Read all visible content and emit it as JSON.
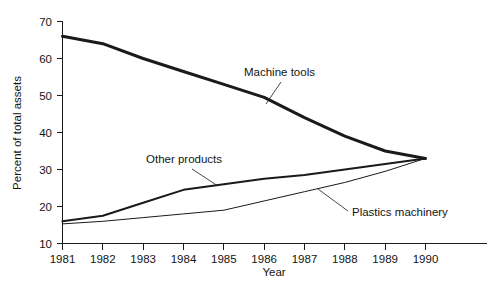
{
  "chart_data": {
    "type": "line",
    "title": "",
    "xlabel": "Year",
    "ylabel": "Percent of total assets",
    "grid": false,
    "legend_position": "inline-annotations",
    "x": [
      1981,
      1982,
      1983,
      1984,
      1985,
      1986,
      1987,
      1988,
      1989,
      1990
    ],
    "categories": [
      "1981",
      "1982",
      "1983",
      "1984",
      "1985",
      "1986",
      "1987",
      "1988",
      "1989",
      "1990"
    ],
    "xlim": [
      1981,
      1990
    ],
    "ylim": [
      10,
      70
    ],
    "ytick_values": [
      10,
      20,
      30,
      40,
      50,
      60,
      70
    ],
    "ytick_labels": [
      "10",
      "20",
      "30",
      "40",
      "50",
      "60",
      "70"
    ],
    "xtick_labels": [
      "1981",
      "1982",
      "1983",
      "1984",
      "1985",
      "1986",
      "1987",
      "1988",
      "1989",
      "1990"
    ],
    "series": [
      {
        "name": "Machine tools",
        "values": [
          66.0,
          64.0,
          60.0,
          56.5,
          53.0,
          49.5,
          44.0,
          39.0,
          35.0,
          33.0
        ],
        "line_width": 3.0,
        "color": "#1a1a1a"
      },
      {
        "name": "Other products",
        "values": [
          16.0,
          17.5,
          21.0,
          24.5,
          26.0,
          27.5,
          28.5,
          30.0,
          31.5,
          33.0
        ],
        "line_width": 2.0,
        "color": "#1a1a1a"
      },
      {
        "name": "Plastics machinery",
        "values": [
          15.3,
          16.0,
          17.0,
          18.0,
          19.0,
          21.5,
          24.0,
          26.5,
          29.5,
          33.0
        ],
        "line_width": 1.0,
        "color": "#1a1a1a"
      }
    ],
    "annotations": [
      {
        "text": "Machine tools",
        "label_x": 244,
        "label_y": 76,
        "leader_from_x": 281,
        "leader_from_y": 82,
        "leader_to_x": 266,
        "leader_to_y": 104
      },
      {
        "text": "Other products",
        "label_x": 146,
        "label_y": 163,
        "leader_from_x": 192,
        "leader_from_y": 169,
        "leader_to_x": 218,
        "leader_to_y": 186
      },
      {
        "text": "Plastics machinery",
        "label_x": 352,
        "label_y": 216,
        "leader_from_x": 348,
        "leader_from_y": 211,
        "leader_to_x": 318,
        "leader_to_y": 189
      }
    ]
  },
  "colors": {
    "background": "#ffffff",
    "ink": "#1a1a1a",
    "axis": "#1a1a1a"
  }
}
